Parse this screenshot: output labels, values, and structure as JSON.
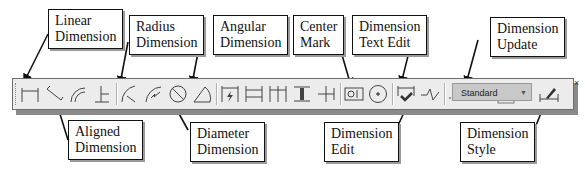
{
  "callouts": {
    "linear": {
      "line1": "Linear",
      "line2": "Dimension"
    },
    "radius": {
      "line1": "Radius",
      "line2": "Dimension"
    },
    "angular": {
      "line1": "Angular",
      "line2": "Dimension"
    },
    "center_mark": {
      "line1": "Center",
      "line2": "Mark"
    },
    "text_edit": {
      "line1": "Dimension",
      "line2": "Text Edit"
    },
    "update": {
      "line1": "Dimension",
      "line2": "Update"
    },
    "aligned": {
      "line1": "Aligned",
      "line2": "Dimension"
    },
    "diameter": {
      "line1": "Diameter",
      "line2": "Dimension"
    },
    "edit": {
      "line1": "Dimension",
      "line2": "Edit"
    },
    "style": {
      "line1": "Dimension",
      "line2": "Style"
    }
  },
  "toolbar": {
    "style_select_value": "Standard",
    "close_label": "×",
    "buttons": [
      "linear-dimension",
      "aligned-dimension",
      "arc-length",
      "ordinate-dimension",
      "radius-dimension",
      "jogged-dimension",
      "diameter-dimension",
      "angular-dimension",
      "quick-dimension",
      "baseline-dimension",
      "continue-dimension",
      "dimension-space",
      "dimension-break",
      "tolerance",
      "center-mark",
      "inspection",
      "jogged-linear",
      "dimension-edit",
      "dimension-text-edit",
      "dimension-update",
      "dimension-style"
    ]
  }
}
